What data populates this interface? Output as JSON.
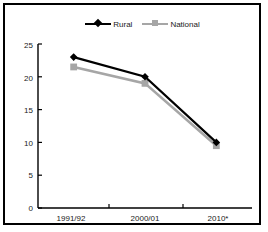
{
  "figure": {
    "background_color": "#ffffff",
    "border_color": "#000000"
  },
  "legend": {
    "position": "top-center",
    "entries": [
      {
        "label": "Rural",
        "color": "#000000",
        "marker": "diamond"
      },
      {
        "label": "National",
        "color": "#a6a6a6",
        "marker": "square"
      }
    ]
  },
  "axes": {
    "y_ticks": [
      "25",
      "20",
      "15",
      "10",
      "5",
      "0"
    ],
    "x_ticks": [
      "1991/92",
      "2000/01",
      "2010*"
    ]
  },
  "chart_data": {
    "type": "line",
    "title": "",
    "xlabel": "",
    "ylabel": "",
    "categories": [
      "1991/92",
      "2000/01",
      "2010*"
    ],
    "series": [
      {
        "name": "Rural",
        "values": [
          23,
          20,
          10
        ],
        "color": "#000000",
        "marker": "diamond"
      },
      {
        "name": "National",
        "values": [
          21.5,
          19,
          9.5
        ],
        "color": "#a6a6a6",
        "marker": "square"
      }
    ],
    "ylim": [
      0,
      25
    ],
    "ytick_step": 5,
    "grid": false,
    "legend_position": "top-center"
  }
}
